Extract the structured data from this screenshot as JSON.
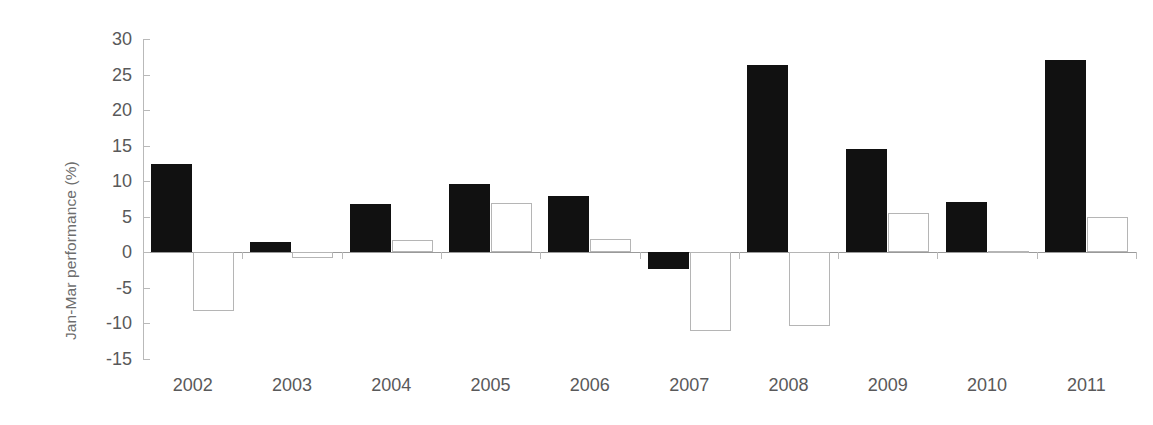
{
  "chart_data": {
    "type": "bar",
    "title": "",
    "xlabel": "",
    "ylabel": "Jan-Mar performance (%)",
    "categories": [
      "2002",
      "2003",
      "2004",
      "2005",
      "2006",
      "2007",
      "2008",
      "2009",
      "2010",
      "2011"
    ],
    "series": [
      {
        "name": "series-1-filled",
        "color": "#111111",
        "values": [
          12.4,
          1.5,
          6.8,
          9.6,
          7.9,
          -2.3,
          26.4,
          14.5,
          7.1,
          27.0
        ]
      },
      {
        "name": "series-2-outline",
        "color": "#ffffff",
        "values": [
          -8.3,
          -0.8,
          1.8,
          7.0,
          1.9,
          -11.1,
          -10.3,
          5.6,
          0.2,
          4.9
        ]
      }
    ],
    "ylim": [
      -15,
      30
    ],
    "yticks": [
      30,
      25,
      20,
      15,
      10,
      5,
      0,
      -5,
      -10,
      -15
    ],
    "ytick_labels": [
      "30",
      "25",
      "20",
      "15",
      "10",
      "5",
      "0",
      "-5",
      "-10",
      "-15"
    ],
    "grid": false,
    "legend": "none",
    "zero_line": true
  },
  "colors": {
    "series_filled": "#111111",
    "series_outline_stroke": "#b5b5b5",
    "axis": "#b9b9b9",
    "zero_line": "#9a9a9a",
    "tick_text": "#59595a",
    "axis_title_text": "#6d6d6d",
    "background": "#ffffff"
  }
}
